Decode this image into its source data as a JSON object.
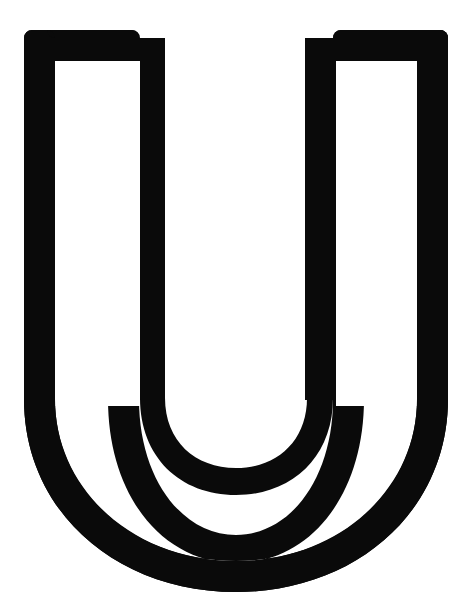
{
  "canvas": {
    "width": 472,
    "height": 604,
    "background_color": "#ffffff"
  },
  "glyph": {
    "character": "U",
    "name": "latin-capital-letter-u",
    "style": "outline-stroke",
    "ink_color": "#0a0a0a",
    "counter_color": "#ffffff",
    "stroke_width_px": 31,
    "corner_radius_px": 8,
    "bounds": {
      "left": 24,
      "top": 30,
      "right": 448,
      "bottom": 592
    },
    "outer_contour": {
      "left_stem_x": 24,
      "right_stem_x": 448,
      "top_y": 30,
      "straight_section_end_y": 395,
      "bowl_bottom_y": 592
    },
    "inner_contour": {
      "left_stem_x": 165,
      "right_stem_x": 305,
      "top_y": 61,
      "straight_section_end_y": 370,
      "bowl_bottom_y": 437
    },
    "left_counter": {
      "left": 55,
      "right": 140,
      "top": 61
    },
    "right_counter": {
      "left": 336,
      "right": 420,
      "top": 61
    },
    "path_outer": "M 24 38 Q 24 30 32 30 L 131 30 Q 140 30 140 38 L 140 398 Q 140 471 196 516 Q 236 548 236 548 Q 236 548 276 516 Q 332 471 332 398 L 332 38 Q 332 30 341 30 L 440 30 Q 448 30 448 38 L 448 398 Q 448 500 385 552 Q 322 604 236 604 Q 150 604 87 552 Q 24 500 24 398 Z",
    "path_inner": "M 55 61 L 55 398 Q 55 470 108 514 Q 161 558 236 558 Q 311 558 364 514 Q 417 470 417 398 L 417 61 L 336 61 L 336 398 Q 336 441 307 467 Q 278 493 236 493 Q 194 493 165 467 Q 136 441 136 398 L 136 61 Z"
  }
}
